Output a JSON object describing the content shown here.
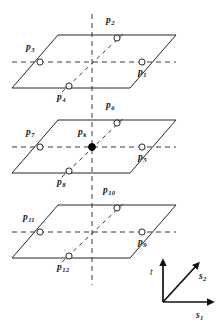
{
  "figure": {
    "type": "geometry-diagram",
    "stroke_color": "#262626",
    "dash_color": "#3a3a3a",
    "marker_fill_open": "#ffffff",
    "marker_fill_solid": "#000000"
  },
  "planes": [
    {
      "name": "top-plane",
      "left": 12,
      "right": 176,
      "top_y": 35,
      "bottom_y": 88,
      "skew": 46
    },
    {
      "name": "middle-plane",
      "left": 12,
      "right": 176,
      "top_y": 120,
      "bottom_y": 173,
      "skew": 46
    },
    {
      "name": "bottom-plane",
      "left": 12,
      "right": 176,
      "top_y": 205,
      "bottom_y": 258,
      "skew": 46
    }
  ],
  "points": [
    {
      "id": "p1",
      "base": "p",
      "sub": "1",
      "cx": 142,
      "cy": 62,
      "marker": "open",
      "label_x": 138,
      "label_y": 68
    },
    {
      "id": "p2",
      "base": "p",
      "sub": "2",
      "cx": 117,
      "cy": 38,
      "marker": "open",
      "label_x": 106,
      "label_y": 16
    },
    {
      "id": "p3",
      "base": "p",
      "sub": "3",
      "cx": 40,
      "cy": 62,
      "marker": "open",
      "label_x": 26,
      "label_y": 43
    },
    {
      "id": "p4",
      "base": "p",
      "sub": "4",
      "cx": 69,
      "cy": 86,
      "marker": "open",
      "label_x": 57,
      "label_y": 93
    },
    {
      "id": "p5",
      "base": "p",
      "sub": "5",
      "cx": 142,
      "cy": 147,
      "marker": "open",
      "label_x": 138,
      "label_y": 153
    },
    {
      "id": "p6",
      "base": "p",
      "sub": "6",
      "cx": 117,
      "cy": 123,
      "marker": "open",
      "label_x": 106,
      "label_y": 101
    },
    {
      "id": "p7",
      "base": "p",
      "sub": "7",
      "cx": 40,
      "cy": 147,
      "marker": "open",
      "label_x": 26,
      "label_y": 128
    },
    {
      "id": "p8",
      "base": "p",
      "sub": "8",
      "cx": 69,
      "cy": 171,
      "marker": "open",
      "label_x": 57,
      "label_y": 178
    },
    {
      "id": "p9",
      "base": "p",
      "sub": "9",
      "cx": 142,
      "cy": 232,
      "marker": "open",
      "label_x": 138,
      "label_y": 238
    },
    {
      "id": "p10",
      "base": "p",
      "sub": "10",
      "cx": 117,
      "cy": 208,
      "marker": "open",
      "label_x": 103,
      "label_y": 186
    },
    {
      "id": "p11",
      "base": "p",
      "sub": "11",
      "cx": 40,
      "cy": 232,
      "marker": "open",
      "label_x": 23,
      "label_y": 213
    },
    {
      "id": "p12",
      "base": "p",
      "sub": "12",
      "cx": 69,
      "cy": 256,
      "marker": "open",
      "label_x": 57,
      "label_y": 263
    },
    {
      "id": "pk",
      "base": "p",
      "sub": "k",
      "cx": 92,
      "cy": 147,
      "marker": "solid",
      "label_x": 78,
      "label_y": 128
    }
  ],
  "guides": {
    "vertical_axis": {
      "x": 92,
      "y1": 14,
      "y2": 285
    },
    "horizontal_rows": [
      {
        "name": "row-top",
        "y": 62,
        "x1": 12,
        "x2": 176
      },
      {
        "name": "row-middle",
        "y": 147,
        "x1": 12,
        "x2": 176
      },
      {
        "name": "row-bottom",
        "y": 232,
        "x1": 12,
        "x2": 176
      }
    ],
    "diagonals": [
      {
        "name": "diag-top",
        "x1": 62,
        "y1": 92,
        "x2": 125,
        "y2": 32
      },
      {
        "name": "diag-middle",
        "x1": 62,
        "y1": 177,
        "x2": 125,
        "y2": 117
      },
      {
        "name": "diag-bottom",
        "x1": 62,
        "y1": 262,
        "x2": 125,
        "y2": 202
      }
    ]
  },
  "axes_legend": {
    "name": "coordinate-axes-legend",
    "origin": {
      "x": 163,
      "y": 302
    },
    "items": [
      {
        "id": "t",
        "label": "t",
        "sub": "",
        "bold": false,
        "label_x": 150,
        "label_y": 268,
        "tip_x": 163,
        "tip_y": 264
      },
      {
        "id": "s2",
        "label": "s",
        "sub": "2",
        "bold": true,
        "label_x": 199,
        "label_y": 272,
        "tip_x": 196,
        "tip_y": 266
      },
      {
        "id": "s1",
        "label": "s",
        "sub": "1",
        "bold": true,
        "label_x": 196,
        "label_y": 311,
        "tip_x": 209,
        "tip_y": 302
      }
    ]
  },
  "caption": {
    "text": ""
  }
}
